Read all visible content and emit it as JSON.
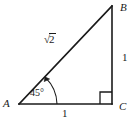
{
  "figure": {
    "kind": "geometry-diagram",
    "background_color": "#ffffff",
    "stroke_color": "#1a1a1a",
    "vertices": {
      "A": {
        "label": "A",
        "x": 19,
        "y": 104
      },
      "B": {
        "label": "B",
        "x": 112,
        "y": 6
      },
      "C": {
        "label": "C",
        "x": 112,
        "y": 104
      }
    },
    "sides": {
      "hypotenuse": {
        "label": "√2",
        "radical_symbol": "√",
        "radicand": "2"
      },
      "right_leg": {
        "label": "1"
      },
      "base_leg": {
        "label": "1"
      }
    },
    "angles": {
      "at_a": {
        "label": "45°",
        "value": "45",
        "unit": "°"
      },
      "at_c": {
        "label": "right-angle-mark",
        "value": "90"
      }
    }
  }
}
